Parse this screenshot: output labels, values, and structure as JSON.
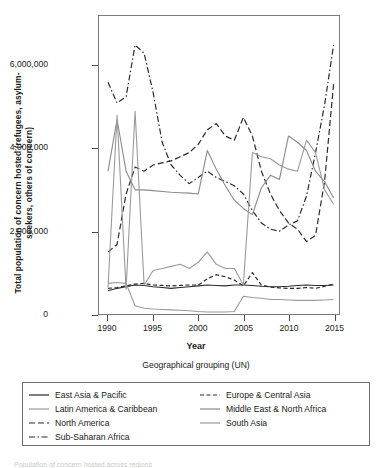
{
  "figure": {
    "ytitle_line1": "Total population of  concern hosted (refugees, asylum-",
    "ytitle_line2": "seekers, others of concern)",
    "xtitle": "Year",
    "legend_title": "Geographical grouping (UN)",
    "bottom_caption": "Population of concern hosted across regions"
  },
  "chart_data": {
    "type": "line",
    "title": "",
    "xlabel": "Year",
    "ylabel": "Total population of  concern hosted (refugees, asylum-seekers, others of concern)",
    "legend_title": "Geographical grouping (UN)",
    "legend_position": "bottom",
    "grid": false,
    "xlim": [
      1989,
      2015.6
    ],
    "ylim": [
      0,
      7200000
    ],
    "xticks": [
      1990,
      1995,
      2000,
      2005,
      2010,
      2015
    ],
    "xtick_labels": [
      "1990",
      "1995",
      "2000",
      "2005",
      "2010",
      "2015"
    ],
    "yticks": [
      0,
      2000000,
      4000000,
      6000000
    ],
    "ytick_labels": [
      "0",
      "2,000,000",
      "4,000,000",
      "6,000,000"
    ],
    "x": [
      1990,
      1991,
      1992,
      1993,
      1994,
      1995,
      1996,
      1997,
      1998,
      1999,
      2000,
      2001,
      2002,
      2003,
      2004,
      2005,
      2006,
      2007,
      2008,
      2009,
      2010,
      2011,
      2012,
      2013,
      2014,
      2015
    ],
    "series": [
      {
        "name": "East Asia & Pacific",
        "style": "solid",
        "color": "#2b2b2b",
        "width": 1.1,
        "values": [
          560000,
          620000,
          660000,
          700000,
          690000,
          660000,
          640000,
          620000,
          640000,
          660000,
          680000,
          700000,
          690000,
          680000,
          700000,
          700000,
          690000,
          670000,
          660000,
          660000,
          670000,
          690000,
          700000,
          690000,
          690000,
          700000
        ]
      },
      {
        "name": "Latin America & Caribbean",
        "style": "solid",
        "color": "#9a9a9a",
        "width": 1.1,
        "values": [
          740000,
          760000,
          740000,
          200000,
          140000,
          120000,
          110000,
          100000,
          90000,
          80000,
          60000,
          50000,
          50000,
          50000,
          60000,
          430000,
          400000,
          380000,
          350000,
          350000,
          340000,
          330000,
          330000,
          330000,
          340000,
          350000
        ]
      },
      {
        "name": "North America",
        "style": "dashed",
        "color": "#2b2b2b",
        "width": 1.2,
        "values": [
          1500000,
          1680000,
          2900000,
          3550000,
          3450000,
          3600000,
          3650000,
          3700000,
          3800000,
          3900000,
          4100000,
          4450000,
          4600000,
          4300000,
          4200000,
          4750000,
          4300000,
          3450000,
          2900000,
          2500000,
          2200000,
          2050000,
          1750000,
          1900000,
          3200000,
          5550000
        ]
      },
      {
        "name": "Sub-Saharan Africa",
        "style": "dashdot",
        "color": "#2b2b2b",
        "width": 1.2,
        "values": [
          5600000,
          5100000,
          5250000,
          6500000,
          6300000,
          5350000,
          4150000,
          3600000,
          3350000,
          3150000,
          3300000,
          3450000,
          3300000,
          3200000,
          3100000,
          2900000,
          2500000,
          2200000,
          2050000,
          2000000,
          2150000,
          2250000,
          2850000,
          3900000,
          5050000,
          6500000
        ]
      },
      {
        "name": "Europe & Central Asia",
        "style": "dashed-short",
        "color": "#2b2b2b",
        "width": 1.2,
        "values": [
          620000,
          640000,
          680000,
          720000,
          740000,
          700000,
          690000,
          680000,
          690000,
          700000,
          700000,
          850000,
          950000,
          900000,
          820000,
          680000,
          1000000,
          700000,
          650000,
          630000,
          620000,
          620000,
          640000,
          620000,
          670000,
          720000
        ]
      },
      {
        "name": "Middle East & North Africa",
        "style": "solid",
        "color": "#8a8a8a",
        "width": 1.1,
        "values": [
          3450000,
          4700000,
          3450000,
          3000000,
          3000000,
          2980000,
          2960000,
          2940000,
          2930000,
          2920000,
          2900000,
          3950000,
          3500000,
          3100000,
          2750000,
          2550000,
          2400000,
          3050000,
          3350000,
          3250000,
          4300000,
          4150000,
          3950000,
          3450000,
          3200000,
          2800000
        ]
      },
      {
        "name": "South Asia",
        "style": "solid",
        "color": "#9a9a9a",
        "width": 1.1,
        "values": [
          640000,
          4800000,
          600000,
          4900000,
          700000,
          1050000,
          1100000,
          1150000,
          1200000,
          1100000,
          1250000,
          1500000,
          1200000,
          1100000,
          1100000,
          700000,
          3900000,
          3800000,
          3750000,
          3600000,
          3500000,
          3450000,
          4200000,
          3900000,
          3000000,
          2650000
        ]
      }
    ]
  },
  "legend": {
    "items": [
      {
        "label": "East Asia & Pacific",
        "style": "solid",
        "color": "#2b2b2b"
      },
      {
        "label": "Latin America & Caribbean",
        "style": "solid",
        "color": "#9a9a9a"
      },
      {
        "label": "North America",
        "style": "dashed",
        "color": "#2b2b2b"
      },
      {
        "label": "Sub-Saharan Africa",
        "style": "dashdot",
        "color": "#2b2b2b"
      },
      {
        "label": "Europe & Central Asia",
        "style": "dashed-short",
        "color": "#2b2b2b"
      },
      {
        "label": "Middle East & North Africa",
        "style": "solid",
        "color": "#8a8a8a"
      },
      {
        "label": "South Asia",
        "style": "solid",
        "color": "#9a9a9a"
      }
    ]
  }
}
